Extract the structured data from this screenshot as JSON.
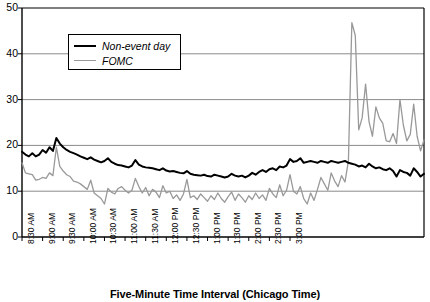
{
  "chart_data": {
    "type": "line",
    "title": "",
    "xlabel": "Five-Minute Time Interval (Chicago Time)",
    "ylabel": "",
    "ylim": [
      0,
      50
    ],
    "yticks": [
      0,
      10,
      20,
      30,
      40,
      50
    ],
    "grid": true,
    "legend_position": "top-left-inside",
    "xtick_labels": [
      "8:30 AM",
      "9:00 AM",
      "9:30 AM",
      "10:00 AM",
      "10:30 AM",
      "11:00 AM",
      "11:30 AM",
      "12:00 PM",
      "12:30 PM",
      "1:00 PM",
      "1:30 PM",
      "2:00 PM",
      "2:30 PM",
      "3:00 PM"
    ],
    "x_interval_minutes": 5,
    "x_start": "8:30 AM",
    "x_end": "3:05 PM",
    "series": [
      {
        "name": "Non-event day",
        "color": "#000000",
        "values": [
          18.6,
          18.0,
          17.6,
          18.3,
          17.6,
          18.0,
          19.0,
          18.4,
          19.6,
          18.8,
          21.6,
          20.4,
          19.6,
          19.0,
          18.6,
          18.3,
          18.0,
          17.6,
          17.3,
          17.0,
          17.4,
          16.9,
          16.6,
          16.3,
          16.6,
          17.2,
          16.4,
          16.0,
          15.7,
          15.6,
          15.4,
          15.2,
          15.6,
          16.8,
          15.8,
          15.4,
          15.2,
          15.1,
          15.0,
          14.8,
          14.6,
          15.0,
          14.5,
          14.3,
          14.4,
          14.2,
          14.0,
          13.9,
          14.4,
          13.8,
          13.6,
          13.5,
          13.4,
          13.6,
          13.3,
          13.2,
          13.6,
          13.4,
          13.2,
          13.0,
          13.2,
          13.8,
          13.4,
          13.2,
          13.4,
          13.0,
          13.4,
          14.0,
          13.6,
          14.2,
          14.6,
          14.2,
          14.8,
          15.0,
          14.6,
          15.4,
          15.2,
          15.6,
          17.0,
          16.4,
          16.6,
          17.2,
          16.2,
          16.4,
          16.6,
          16.4,
          16.2,
          16.6,
          16.4,
          16.2,
          16.6,
          16.4,
          16.2,
          16.4,
          16.6,
          16.2,
          16.0,
          15.8,
          15.4,
          15.6,
          15.2,
          16.0,
          15.4,
          15.0,
          15.2,
          14.8,
          14.6,
          15.0,
          14.4,
          13.2,
          14.6,
          14.2,
          14.0,
          13.4,
          15.0,
          14.2,
          13.2,
          13.8
        ]
      },
      {
        "name": "FOMC",
        "color": "#999999",
        "values": [
          16.2,
          14.0,
          13.8,
          13.6,
          12.4,
          12.6,
          13.0,
          12.8,
          14.0,
          13.4,
          19.6,
          15.4,
          14.4,
          13.6,
          13.2,
          12.2,
          12.0,
          11.6,
          11.0,
          10.4,
          12.4,
          9.6,
          9.0,
          8.4,
          7.2,
          10.6,
          9.8,
          9.4,
          10.6,
          11.0,
          10.2,
          9.6,
          10.2,
          12.8,
          11.0,
          9.6,
          10.8,
          9.0,
          10.4,
          9.8,
          8.6,
          11.2,
          9.6,
          10.0,
          8.4,
          9.2,
          8.0,
          9.4,
          12.6,
          8.6,
          9.0,
          8.2,
          9.4,
          8.6,
          7.8,
          9.0,
          8.2,
          9.6,
          8.4,
          7.6,
          8.8,
          9.8,
          8.0,
          9.4,
          8.6,
          7.6,
          9.0,
          8.2,
          9.6,
          8.4,
          9.2,
          8.0,
          10.6,
          9.4,
          8.6,
          11.4,
          9.0,
          10.2,
          13.6,
          10.0,
          9.4,
          11.0,
          8.4,
          7.2,
          9.6,
          8.0,
          10.4,
          13.0,
          11.6,
          10.2,
          14.0,
          12.2,
          11.0,
          13.4,
          12.0,
          16.6,
          46.8,
          44.0,
          23.4,
          26.0,
          33.4,
          25.2,
          22.0,
          28.4,
          26.0,
          24.8,
          21.0,
          20.8,
          22.6,
          20.4,
          30.0,
          24.4,
          21.0,
          22.4,
          29.0,
          22.0,
          18.8,
          21.2
        ]
      }
    ]
  },
  "legend": {
    "items": [
      {
        "label": "Non-event day",
        "color": "#000000"
      },
      {
        "label": "FOMC",
        "color": "#999999"
      }
    ]
  },
  "axis": {
    "y_tick_labels": [
      "50",
      "40",
      "30",
      "20",
      "10",
      "0"
    ],
    "x_title": "Five-Minute Time Interval (Chicago Time)"
  }
}
